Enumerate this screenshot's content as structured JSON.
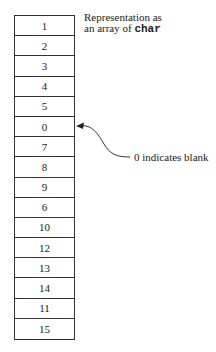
{
  "caption": {
    "line1": "Representation as",
    "line2_prefix": "an array of ",
    "line2_code": "char"
  },
  "array": {
    "cells": [
      "1",
      "2",
      "3",
      "4",
      "5",
      "0",
      "7",
      "8",
      "9",
      "6",
      "10",
      "12",
      "13",
      "14",
      "11",
      "15"
    ],
    "highlighted_index": 5
  },
  "annotation": {
    "text": "0 indicates blank",
    "target_cell_value": "0"
  }
}
